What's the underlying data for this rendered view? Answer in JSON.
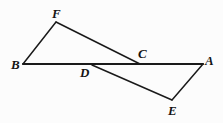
{
  "figure": {
    "canvas": {
      "width": 223,
      "height": 123
    },
    "background_color": "#fcfcfc",
    "stroke_color": "#1a1a1a",
    "points": {
      "A": {
        "x": 203,
        "y": 64
      },
      "B": {
        "x": 23,
        "y": 64
      },
      "C": {
        "x": 140,
        "y": 64
      },
      "D": {
        "x": 92,
        "y": 65
      },
      "E": {
        "x": 172,
        "y": 100
      },
      "F": {
        "x": 56,
        "y": 22
      }
    },
    "segments": [
      {
        "name": "segment-BA",
        "from": "B",
        "to": "A",
        "width": 2.2
      },
      {
        "name": "segment-BF",
        "from": "B",
        "to": "F",
        "width": 1.5
      },
      {
        "name": "segment-FC",
        "from": "F",
        "to": "C",
        "width": 1.5
      },
      {
        "name": "segment-DE",
        "from": "D",
        "to": "E",
        "width": 1.5
      },
      {
        "name": "segment-EA",
        "from": "E",
        "to": "A",
        "width": 1.5
      }
    ],
    "labels": [
      {
        "id": "F",
        "text": "F",
        "left": 52,
        "top": 7
      },
      {
        "id": "B",
        "text": "B",
        "left": 11,
        "top": 58
      },
      {
        "id": "C",
        "text": "C",
        "left": 138,
        "top": 47
      },
      {
        "id": "A",
        "text": "A",
        "left": 205,
        "top": 54
      },
      {
        "id": "D",
        "text": "D",
        "left": 80,
        "top": 66
      },
      {
        "id": "E",
        "text": "E",
        "left": 168,
        "top": 104
      }
    ]
  }
}
